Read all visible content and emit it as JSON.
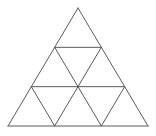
{
  "diagram": {
    "title": "",
    "rows": 3,
    "small_triangle_count": 9,
    "stroke_color": "#5a5a5a",
    "background_color": "#ffffff",
    "stroke_width": 1,
    "vertices": {
      "apex": [
        78,
        8
      ],
      "bottom_left": [
        8,
        126
      ],
      "bottom_right": [
        148,
        126
      ]
    }
  }
}
